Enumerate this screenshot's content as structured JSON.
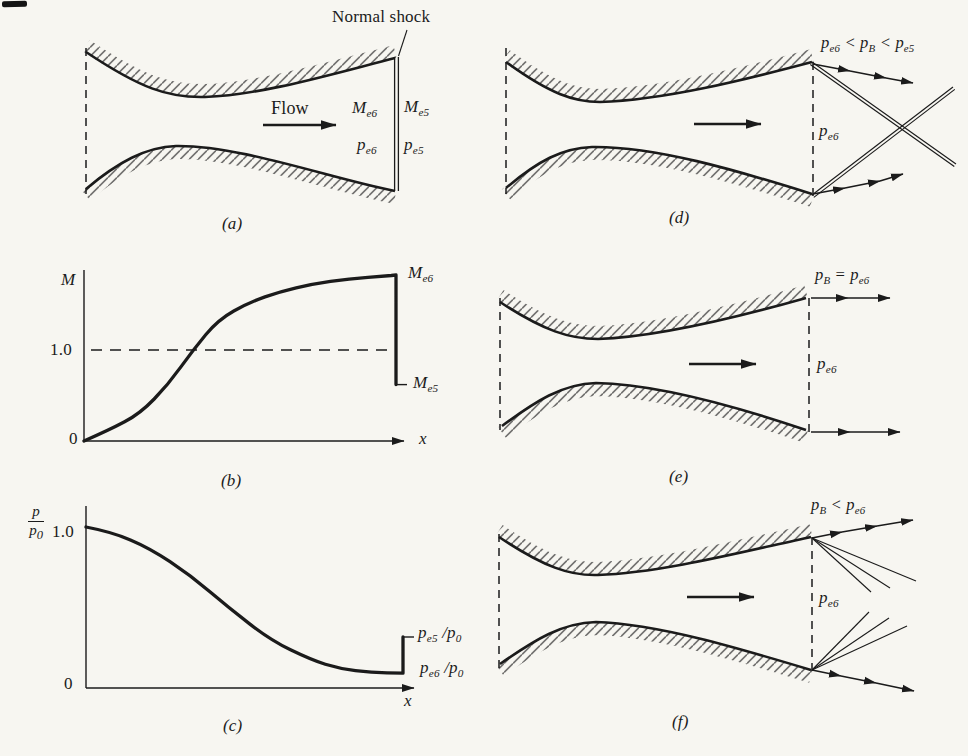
{
  "page": {
    "background": "#f7f6f1",
    "ink": "#1b1b1b"
  },
  "panels": {
    "a": {
      "tag": "(a)",
      "shock_callout": "Normal shock",
      "flow_label": "Flow",
      "mach_upstream": [
        {
          "t": "M"
        },
        {
          "sub": "e6"
        }
      ],
      "mach_downstream": [
        {
          "t": "M"
        },
        {
          "sub": "e5"
        }
      ],
      "pressure_upstream": [
        {
          "t": "p"
        },
        {
          "sub": "e6"
        }
      ],
      "pressure_downstream": [
        {
          "t": "p"
        },
        {
          "sub": "e5"
        }
      ]
    },
    "b": {
      "tag": "(b)",
      "ylabel": "M",
      "xlabel": "x",
      "tick_one": "1.0",
      "tick_zero": "0",
      "label_top": [
        {
          "t": "M"
        },
        {
          "sub": "e6"
        }
      ],
      "label_bottom": [
        {
          "t": "M"
        },
        {
          "sub": "e5"
        }
      ]
    },
    "c": {
      "tag": "(c)",
      "ylabel_num": "p",
      "ylabel_den": [
        {
          "t": "p"
        },
        {
          "sub": "0"
        }
      ],
      "xlabel": "x",
      "tick_one": "1.0",
      "tick_zero": "0",
      "label_top": [
        {
          "t": "p"
        },
        {
          "sub": "e5"
        },
        {
          "t": " /"
        },
        {
          "t": "p"
        },
        {
          "sub": "0"
        }
      ],
      "label_bottom": [
        {
          "t": "p"
        },
        {
          "sub": "e6"
        },
        {
          "t": " /"
        },
        {
          "t": "p"
        },
        {
          "sub": "0"
        }
      ]
    },
    "d": {
      "tag": "(d)",
      "condition": [
        {
          "t": "p"
        },
        {
          "sub": "e6"
        },
        {
          "t": " < "
        },
        {
          "t": "p"
        },
        {
          "sub": "B"
        },
        {
          "t": " < "
        },
        {
          "t": "p"
        },
        {
          "sub": "e5"
        }
      ],
      "exit_pressure": [
        {
          "t": "p"
        },
        {
          "sub": "e6"
        }
      ]
    },
    "e": {
      "tag": "(e)",
      "condition": [
        {
          "t": "p"
        },
        {
          "sub": "B"
        },
        {
          "t": " = "
        },
        {
          "t": "p"
        },
        {
          "sub": "e6"
        }
      ],
      "exit_pressure": [
        {
          "t": "p"
        },
        {
          "sub": "e6"
        }
      ]
    },
    "f": {
      "tag": "(f)",
      "condition": [
        {
          "t": "p"
        },
        {
          "sub": "B"
        },
        {
          "t": " < "
        },
        {
          "t": "p"
        },
        {
          "sub": "e6"
        }
      ],
      "exit_pressure": [
        {
          "t": "p"
        },
        {
          "sub": "e6"
        }
      ]
    }
  },
  "chart_data": [
    {
      "id": "b",
      "type": "line",
      "title": "Mach number distribution along nozzle with normal shock at exit plane",
      "xlabel": "x",
      "ylabel": "M",
      "ylim": [
        0,
        1.9
      ],
      "reference_line_y": 1.0,
      "grid": false,
      "legend": false,
      "series": [
        {
          "name": "M(x)",
          "x": [
            0,
            0.08,
            0.18,
            0.27,
            0.35,
            0.43,
            0.53,
            0.63,
            0.73,
            0.85,
            0.97,
            1.0
          ],
          "y": [
            0,
            0.12,
            0.3,
            0.62,
            1.0,
            1.33,
            1.52,
            1.64,
            1.72,
            1.78,
            1.81,
            1.82
          ]
        }
      ],
      "discontinuity": {
        "x": 1.0,
        "from": 1.82,
        "to": 0.62,
        "upper_label": "M_e6",
        "lower_label": "M_e5"
      }
    },
    {
      "id": "c",
      "type": "line",
      "title": "Pressure ratio distribution along nozzle with normal shock at exit plane",
      "xlabel": "x",
      "ylabel": "p/p0",
      "ylim": [
        0,
        1.1
      ],
      "grid": false,
      "legend": false,
      "series": [
        {
          "name": "p/p0",
          "x": [
            0,
            0.08,
            0.2,
            0.33,
            0.45,
            0.58,
            0.71,
            0.8,
            0.9,
            1.0
          ],
          "y": [
            1.0,
            0.97,
            0.87,
            0.7,
            0.5,
            0.3,
            0.175,
            0.12,
            0.095,
            0.092
          ]
        }
      ],
      "discontinuity": {
        "x": 1.0,
        "from": 0.092,
        "to": 0.317,
        "upper_label": "p_e5/p0",
        "lower_label": "p_e6/p0"
      }
    }
  ]
}
